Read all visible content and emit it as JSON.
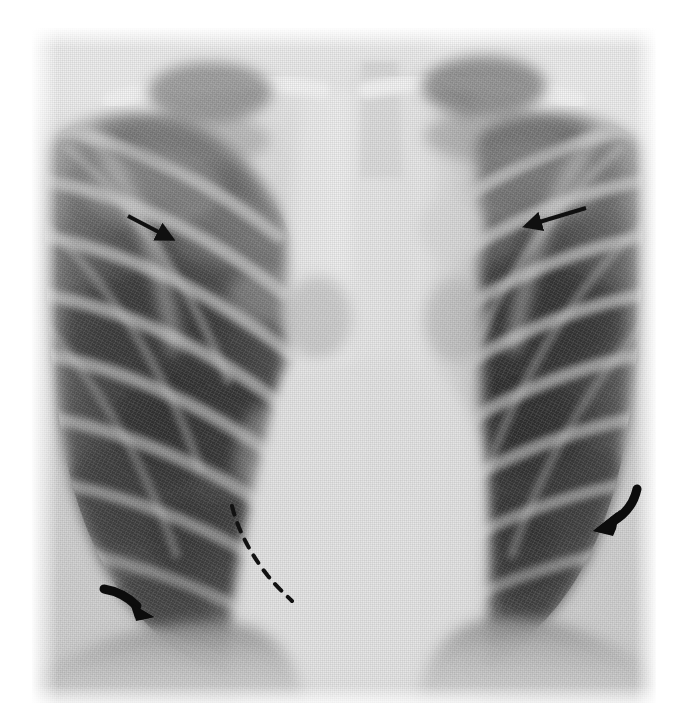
{
  "image": {
    "kind": "chest-radiograph",
    "view": "frontal-pa",
    "modality_label": "X-ray",
    "panel": {
      "x": 32,
      "y": 28,
      "width": 624,
      "height": 675
    },
    "background_color": "#ffffff",
    "film_base_color": "#d9d9d9",
    "lung_field_color": "#4a4a4a",
    "mediastinum_color": "#e8e8e8",
    "annotation_color": "#111111"
  },
  "annotations": {
    "items": [
      {
        "id": "upper-left-straight-arrow",
        "type": "straight-arrow",
        "direction": "down-right",
        "tail": {
          "x": 128,
          "y": 216
        },
        "head": {
          "x": 180,
          "y": 243
        },
        "thickness": 4,
        "color": "#101010"
      },
      {
        "id": "upper-right-straight-arrow",
        "type": "straight-arrow",
        "direction": "left",
        "tail": {
          "x": 586,
          "y": 208
        },
        "head": {
          "x": 519,
          "y": 228
        },
        "thickness": 4,
        "color": "#101010"
      },
      {
        "id": "lower-right-curved-arrow",
        "type": "curved-arrow",
        "direction": "down-left",
        "tail": {
          "x": 637,
          "y": 489
        },
        "head": {
          "x": 597,
          "y": 528
        },
        "thickness": 9,
        "color": "#0c0c0c"
      },
      {
        "id": "lower-left-curved-arrow",
        "type": "curved-arrow",
        "direction": "down-right",
        "tail": {
          "x": 104,
          "y": 589
        },
        "head": {
          "x": 151,
          "y": 616
        },
        "thickness": 9,
        "color": "#0c0c0c"
      },
      {
        "id": "central-dashed-line",
        "type": "dashed-curve",
        "description": "dashed curvilinear marker along right mediastinal/heart border",
        "start": {
          "x": 232,
          "y": 506
        },
        "end": {
          "x": 290,
          "y": 600
        },
        "dash_pattern": "9 9",
        "thickness": 4,
        "color": "#121212"
      }
    ]
  },
  "anatomy": {
    "regions": [
      {
        "name": "right-lung-field",
        "side": "viewer-left"
      },
      {
        "name": "left-lung-field",
        "side": "viewer-right"
      },
      {
        "name": "mediastinum",
        "side": "center"
      },
      {
        "name": "trachea",
        "side": "center-upper"
      },
      {
        "name": "right-clavicle",
        "side": "viewer-left-upper"
      },
      {
        "name": "left-clavicle",
        "side": "viewer-right-upper"
      },
      {
        "name": "right-hemidiaphragm",
        "side": "viewer-left-lower"
      },
      {
        "name": "left-hemidiaphragm",
        "side": "viewer-right-lower"
      },
      {
        "name": "rib-cage",
        "side": "bilateral"
      },
      {
        "name": "cardiac-silhouette",
        "side": "center-lower"
      }
    ]
  }
}
